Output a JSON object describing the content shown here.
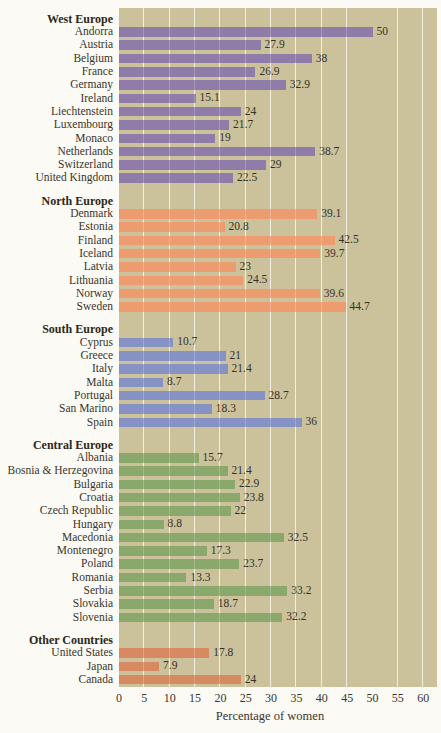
{
  "chart_data": {
    "type": "bar",
    "orientation": "horizontal",
    "title": "",
    "xlabel": "Percentage of women",
    "ylabel": "",
    "xlim": [
      0,
      60
    ],
    "xticks": [
      0,
      5,
      10,
      15,
      20,
      25,
      30,
      35,
      40,
      45,
      50,
      55,
      60
    ],
    "grid": true,
    "plot_background": "#cbc29b",
    "grid_color": "#f0ecda",
    "groups": [
      {
        "name": "West Europe",
        "color": "#8f7ca8",
        "items": [
          {
            "label": "Andorra",
            "value": 50
          },
          {
            "label": "Austria",
            "value": 27.9
          },
          {
            "label": "Belgium",
            "value": 38
          },
          {
            "label": "France",
            "value": 26.9
          },
          {
            "label": "Germany",
            "value": 32.9
          },
          {
            "label": "Ireland",
            "value": 15.1
          },
          {
            "label": "Liechtenstein",
            "value": 24
          },
          {
            "label": "Luxembourg",
            "value": 21.7
          },
          {
            "label": "Monaco",
            "value": 19
          },
          {
            "label": "Netherlands",
            "value": 38.7
          },
          {
            "label": "Switzerland",
            "value": 29
          },
          {
            "label": "United Kingdom",
            "value": 22.5
          }
        ]
      },
      {
        "name": "North Europe",
        "color": "#ec9c6f",
        "items": [
          {
            "label": "Denmark",
            "value": 39.1
          },
          {
            "label": "Estonia",
            "value": 20.8
          },
          {
            "label": "Finland",
            "value": 42.5
          },
          {
            "label": "Iceland",
            "value": 39.7
          },
          {
            "label": "Latvia",
            "value": 23
          },
          {
            "label": "Lithuania",
            "value": 24.5
          },
          {
            "label": "Norway",
            "value": 39.6
          },
          {
            "label": "Sweden",
            "value": 44.7
          }
        ]
      },
      {
        "name": "South Europe",
        "color": "#8691c4",
        "items": [
          {
            "label": "Cyprus",
            "value": 10.7
          },
          {
            "label": "Greece",
            "value": 21
          },
          {
            "label": "Italy",
            "value": 21.4
          },
          {
            "label": "Malta",
            "value": 8.7
          },
          {
            "label": "Portugal",
            "value": 28.7
          },
          {
            "label": "San Marino",
            "value": 18.3
          },
          {
            "label": "Spain",
            "value": 36
          }
        ]
      },
      {
        "name": "Central Europe",
        "color": "#8aa76c",
        "items": [
          {
            "label": "Albania",
            "value": 15.7
          },
          {
            "label": "Bosnia & Herzegovina",
            "value": 21.4
          },
          {
            "label": "Bulgaria",
            "value": 22.9
          },
          {
            "label": "Croatia",
            "value": 23.8
          },
          {
            "label": "Czech Republic",
            "value": 22
          },
          {
            "label": "Hungary",
            "value": 8.8
          },
          {
            "label": "Macedonia",
            "value": 32.5
          },
          {
            "label": "Montenegro",
            "value": 17.3
          },
          {
            "label": "Poland",
            "value": 23.7
          },
          {
            "label": "Romania",
            "value": 13.3
          },
          {
            "label": "Serbia",
            "value": 33.2
          },
          {
            "label": "Slovakia",
            "value": 18.7
          },
          {
            "label": "Slovenia",
            "value": 32.2
          }
        ]
      },
      {
        "name": "Other Countries",
        "color": "#d78a61",
        "items": [
          {
            "label": "United States",
            "value": 17.8
          },
          {
            "label": "Japan",
            "value": 7.9
          },
          {
            "label": "Canada",
            "value": 24
          }
        ]
      }
    ]
  }
}
